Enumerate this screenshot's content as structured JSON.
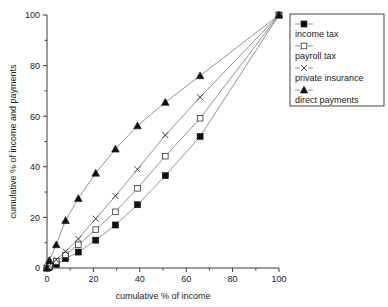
{
  "chart_data": {
    "type": "line",
    "title": "",
    "xlabel": "cumulative % of income",
    "ylabel": "cumulative % of income and payments",
    "xlim": [
      0,
      100
    ],
    "ylim": [
      0,
      100
    ],
    "xticks": [
      0,
      20,
      40,
      60,
      80,
      100
    ],
    "yticks": [
      0,
      20,
      40,
      60,
      80,
      100
    ],
    "xtick_labels": [
      "0",
      "20",
      "40",
      "60",
      "80",
      "100"
    ],
    "ytick_labels": [
      "0",
      "20",
      "40",
      "60",
      "80",
      "100"
    ],
    "minor_ticks": true,
    "grid": false,
    "legend_position": "upper right (outside plot)",
    "x": [
      0,
      1,
      4,
      8,
      13.5,
      21,
      29.5,
      39,
      51,
      66,
      100
    ],
    "series": [
      {
        "name": "income tax",
        "marker": "filled-square",
        "values": [
          0,
          0.3,
          1.5,
          3.7,
          6.3,
          11,
          17,
          25,
          36.5,
          52,
          100
        ]
      },
      {
        "name": "payroll tax",
        "marker": "open-square",
        "values": [
          0,
          0.7,
          2.6,
          5.2,
          9.2,
          15.2,
          22.2,
          31.5,
          44.2,
          59.2,
          100
        ]
      },
      {
        "name": "private insurance",
        "marker": "x-cross",
        "values": [
          0,
          0.9,
          3.3,
          6.5,
          11.5,
          19.5,
          28.5,
          39,
          52.5,
          67.5,
          100
        ]
      },
      {
        "name": "direct payments",
        "marker": "filled-triangle",
        "values": [
          0,
          3.0,
          9.2,
          18.8,
          27.5,
          37.5,
          47.0,
          56.2,
          65.5,
          76.0,
          100
        ]
      }
    ]
  },
  "legend": {
    "entries": [
      {
        "label": "income tax",
        "marker": "filled-square"
      },
      {
        "label": "payroll tax",
        "marker": "open-square"
      },
      {
        "label": "private insurance",
        "marker": "x-cross"
      },
      {
        "label": "direct payments",
        "marker": "filled-triangle"
      }
    ]
  },
  "axes": {
    "x_title": "cumulative % of income",
    "y_title": "cumulative % of income and payments"
  }
}
